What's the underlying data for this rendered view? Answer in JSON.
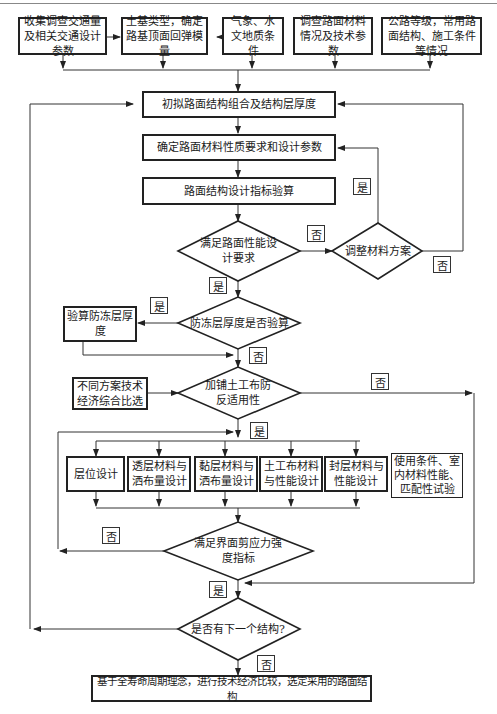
{
  "diagram": {
    "top_inputs": [
      {
        "id": "in1",
        "text": "收集调查交通量及相关交通设计参数"
      },
      {
        "id": "in2",
        "text": "土基类型，确定路基顶面回弹模量"
      },
      {
        "id": "in3",
        "text": "气象、水文地质条件"
      },
      {
        "id": "in4",
        "text": "调查路面材料情况及技术参数"
      },
      {
        "id": "in5",
        "text": "公路等级，常用路面结构、施工条件等情况"
      }
    ],
    "process": {
      "initial_structure": "初拟路面结构组合及结构层厚度",
      "material_params": "确定路面材料性质要求和设计参数",
      "design_check": "路面结构设计指标验算",
      "frost_check_box": "验算防冻层厚度",
      "tech_econ_compare": "不同方案技术经济综合比选",
      "final": "基于全寿命周期理念，进行技术经济比较，选定采用的路面结构"
    },
    "decisions": {
      "performance": "满足路面性能设计要求",
      "adjust_material": "调整材料方案",
      "frost": "防冻层厚度是否验算",
      "geotextile": "加铺土工布防反适用性",
      "shear": "满足界面剪应力强度指标",
      "next_structure": "是否有下一个结构?"
    },
    "design_items": [
      "层位设计",
      "透层材料与洒布量设计",
      "黏层材料与洒布量设计",
      "土工布材料与性能设计",
      "封层材料与性能设计"
    ],
    "side_note": "使用条件、室内材料性能、匹配性试验",
    "labels": {
      "yes": "是",
      "no": "否"
    }
  }
}
